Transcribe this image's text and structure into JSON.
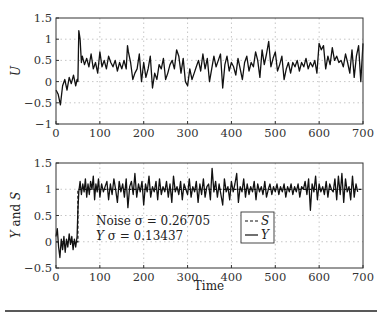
{
  "chart_data": [
    {
      "type": "line",
      "title": "",
      "xlabel": "",
      "ylabel": "U",
      "xlim": [
        0,
        700
      ],
      "ylim": [
        -1,
        1.5
      ],
      "xticks": [
        0,
        100,
        200,
        300,
        400,
        500,
        600,
        700
      ],
      "yticks": [
        -1,
        -0.5,
        0,
        0.5,
        1,
        1.5
      ],
      "ytick_labels": [
        "−1",
        "−0.5",
        "0",
        "0.5",
        "1",
        "1.5"
      ],
      "grid": true,
      "series": [
        {
          "name": "U",
          "style": "solid",
          "x": [
            0,
            5,
            10,
            15,
            20,
            25,
            30,
            35,
            40,
            45,
            48,
            50,
            52,
            55,
            58,
            60,
            65,
            70,
            75,
            80,
            85,
            90,
            95,
            100,
            105,
            110,
            115,
            120,
            125,
            130,
            135,
            140,
            145,
            150,
            155,
            160,
            163,
            165,
            170,
            175,
            180,
            185,
            190,
            195,
            200,
            205,
            210,
            215,
            220,
            225,
            230,
            235,
            240,
            245,
            250,
            255,
            260,
            265,
            270,
            275,
            280,
            285,
            290,
            295,
            300,
            305,
            310,
            315,
            320,
            325,
            330,
            335,
            340,
            345,
            350,
            355,
            360,
            365,
            370,
            375,
            380,
            385,
            390,
            395,
            400,
            405,
            410,
            415,
            420,
            425,
            430,
            435,
            440,
            445,
            450,
            455,
            460,
            465,
            470,
            475,
            480,
            485,
            490,
            495,
            500,
            505,
            510,
            515,
            520,
            525,
            530,
            535,
            540,
            545,
            550,
            555,
            560,
            565,
            570,
            575,
            580,
            585,
            590,
            595,
            600,
            605,
            610,
            615,
            620,
            625,
            630,
            635,
            640,
            645,
            650,
            655,
            660,
            665,
            670,
            675,
            680,
            685,
            690,
            695,
            700
          ],
          "values": [
            -0.2,
            -0.3,
            -0.55,
            -0.1,
            0.05,
            -0.2,
            0.1,
            -0.05,
            0.15,
            -0.1,
            0.05,
            0.0,
            1.2,
            1.0,
            0.45,
            0.6,
            0.4,
            0.55,
            0.35,
            0.65,
            0.3,
            0.45,
            0.2,
            0.7,
            0.35,
            0.5,
            0.3,
            0.6,
            0.45,
            0.35,
            0.5,
            0.25,
            0.45,
            0.3,
            0.5,
            0.3,
            0.85,
            0.7,
            0.45,
            0.05,
            0.2,
            0.3,
            0.65,
            0.0,
            0.45,
            0.1,
            0.3,
            0.6,
            -0.15,
            0.2,
            0.05,
            0.4,
            0.3,
            0.55,
            0.05,
            0.2,
            0.4,
            0.5,
            0.3,
            0.75,
            0.6,
            0.2,
            0.55,
            0.0,
            -0.1,
            0.3,
            0.05,
            0.2,
            0.35,
            0.5,
            0.25,
            0.65,
            0.3,
            0.55,
            0.0,
            0.3,
            0.6,
            0.35,
            0.5,
            0.65,
            -0.15,
            0.4,
            0.6,
            0.25,
            0.45,
            0.35,
            0.15,
            0.55,
            0.3,
            0.05,
            0.45,
            0.6,
            0.25,
            0.45,
            0.35,
            0.7,
            0.5,
            0.1,
            0.75,
            0.4,
            0.65,
            0.95,
            0.35,
            0.55,
            0.7,
            0.25,
            0.4,
            0.6,
            0.05,
            0.3,
            0.45,
            0.2,
            0.45,
            0.35,
            0.5,
            0.25,
            0.45,
            0.35,
            0.55,
            0.3,
            0.45,
            0.35,
            0.5,
            0.2,
            0.9,
            0.75,
            0.85,
            0.3,
            0.6,
            0.4,
            0.8,
            0.5,
            0.6,
            0.45,
            0.5,
            0.35,
            0.65,
            0.45,
            0.2,
            0.75,
            0.1,
            0.6,
            0.85,
            0.0,
            0.9,
            0.4,
            0.6
          ]
        }
      ]
    },
    {
      "type": "line",
      "title": "",
      "xlabel": "Time",
      "ylabel": "Y and S",
      "xlim": [
        0,
        700
      ],
      "ylim": [
        -0.5,
        1.5
      ],
      "xticks": [
        0,
        100,
        200,
        300,
        400,
        500,
        600,
        700
      ],
      "yticks": [
        -0.5,
        0,
        0.5,
        1,
        1.5
      ],
      "ytick_labels": [
        "−0.5",
        "0",
        "0.5",
        "1",
        "1.5"
      ],
      "grid": true,
      "legend": {
        "position": "inside-center",
        "entries": [
          "S",
          "Y"
        ]
      },
      "annotations": [
        "Noise σ = 0.26705",
        "Y σ = 0.13437"
      ],
      "series": [
        {
          "name": "S",
          "style": "dashed",
          "x": [
            0,
            50,
            50,
            700
          ],
          "values": [
            0,
            0,
            1,
            1
          ]
        },
        {
          "name": "Y",
          "style": "solid",
          "x": [
            0,
            3,
            6,
            9,
            12,
            15,
            18,
            21,
            24,
            27,
            30,
            33,
            36,
            39,
            42,
            45,
            48,
            50,
            52,
            55,
            58,
            61,
            64,
            67,
            70,
            73,
            76,
            79,
            82,
            85,
            88,
            91,
            94,
            97,
            100,
            104,
            108,
            112,
            116,
            120,
            124,
            128,
            132,
            136,
            140,
            144,
            148,
            152,
            156,
            160,
            164,
            168,
            172,
            176,
            180,
            184,
            188,
            192,
            196,
            200,
            204,
            208,
            212,
            216,
            220,
            224,
            228,
            232,
            236,
            240,
            244,
            248,
            252,
            256,
            260,
            264,
            268,
            272,
            276,
            280,
            284,
            288,
            292,
            296,
            300,
            304,
            308,
            312,
            316,
            320,
            324,
            328,
            332,
            336,
            340,
            344,
            348,
            352,
            356,
            360,
            364,
            368,
            372,
            376,
            380,
            384,
            388,
            392,
            396,
            400,
            404,
            408,
            412,
            416,
            420,
            424,
            428,
            432,
            436,
            440,
            444,
            448,
            452,
            456,
            460,
            464,
            468,
            472,
            476,
            480,
            484,
            488,
            492,
            496,
            500,
            504,
            508,
            512,
            516,
            520,
            524,
            528,
            532,
            536,
            540,
            544,
            548,
            552,
            556,
            560,
            564,
            568,
            572,
            576,
            580,
            584,
            588,
            592,
            596,
            600,
            604,
            608,
            612,
            616,
            620,
            624,
            628,
            632,
            636,
            640,
            644,
            648,
            652,
            656,
            660,
            664,
            668,
            672,
            676,
            680,
            684,
            688,
            692,
            696,
            700
          ],
          "values": [
            0.1,
            0.25,
            -0.1,
            -0.3,
            0.05,
            -0.15,
            0.1,
            -0.2,
            0.05,
            -0.1,
            0.15,
            -0.05,
            0.1,
            -0.15,
            0.05,
            -0.1,
            0.1,
            0.6,
            0.95,
            1.15,
            0.9,
            1.1,
            0.95,
            1.2,
            0.85,
            1.1,
            0.9,
            1.15,
            1.0,
            1.25,
            0.8,
            1.1,
            0.95,
            1.2,
            0.85,
            1.1,
            0.95,
            1.05,
            1.15,
            0.8,
            1.1,
            0.9,
            1.2,
            1.0,
            0.75,
            1.15,
            0.95,
            1.1,
            0.85,
            1.2,
            0.65,
            1.05,
            1.15,
            0.9,
            1.3,
            0.85,
            1.1,
            0.95,
            1.15,
            0.7,
            1.1,
            0.95,
            1.25,
            0.85,
            1.05,
            0.95,
            1.15,
            0.8,
            1.2,
            0.9,
            1.05,
            0.95,
            1.15,
            0.85,
            1.1,
            0.75,
            1.25,
            0.95,
            1.05,
            0.9,
            1.15,
            0.8,
            1.1,
            1.0,
            0.9,
            1.2,
            0.85,
            1.05,
            0.95,
            1.15,
            0.75,
            1.1,
            0.9,
            1.2,
            0.85,
            1.05,
            1.1,
            0.8,
            1.4,
            0.95,
            1.15,
            0.85,
            1.1,
            0.9,
            0.7,
            1.2,
            0.95,
            1.05,
            0.8,
            1.15,
            0.95,
            1.1,
            1.3,
            0.75,
            1.05,
            0.95,
            1.2,
            0.85,
            1.1,
            0.9,
            1.05,
            0.95,
            1.15,
            0.8,
            1.1,
            0.95,
            1.05,
            0.9,
            1.15,
            0.85,
            1.0,
            1.1,
            0.9,
            1.05,
            0.95,
            1.1,
            0.9,
            1.05,
            0.95,
            1.1,
            0.85,
            1.05,
            0.95,
            1.1,
            0.9,
            1.05,
            0.95,
            1.1,
            0.85,
            1.05,
            1.0,
            1.15,
            0.9,
            1.2,
            0.6,
            1.1,
            0.95,
            1.25,
            0.8,
            1.1,
            0.95,
            1.05,
            0.9,
            1.15,
            0.85,
            1.1,
            1.0,
            0.95,
            1.2,
            0.8,
            1.25,
            0.9,
            1.3,
            0.75,
            1.2,
            0.95,
            1.05,
            0.8,
            1.25,
            0.85,
            1.1,
            0.95
          ]
        }
      ]
    }
  ],
  "figure": {
    "top_plot": {
      "ylabel": "U"
    },
    "bottom_plot": {
      "ylabel": "Y and S",
      "xlabel": "Time",
      "annotation_noise": "Noise σ = 0.26705",
      "annotation_y_prefix": "Y",
      "annotation_y_suffix": " σ = 0.13437",
      "legend": [
        {
          "label": "S",
          "style": "dashed"
        },
        {
          "label": "Y",
          "style": "solid"
        }
      ]
    },
    "xtick_labels": [
      "0",
      "100",
      "200",
      "300",
      "400",
      "500",
      "600",
      "700"
    ]
  }
}
